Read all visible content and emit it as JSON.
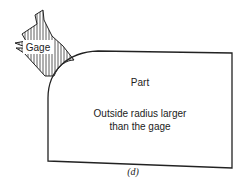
{
  "figure": {
    "caption": "(d)",
    "gage": {
      "label": "Gage"
    },
    "part": {
      "label": "Part",
      "note_line1": "Outside radius larger",
      "note_line2": "than the gage"
    }
  },
  "colors": {
    "stroke": "#222222",
    "background": "#ffffff"
  }
}
